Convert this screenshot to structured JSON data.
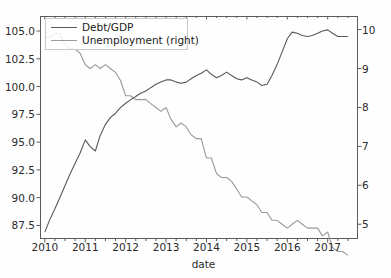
{
  "chart_data": {
    "type": "line",
    "title": "",
    "subtitle": "",
    "xlabel": "date",
    "ylabel": "",
    "ylabel_right": "",
    "grid": false,
    "legend_position": "upper-left",
    "x_ticks": [
      "2010",
      "2011",
      "2012",
      "2013",
      "2014",
      "2015",
      "2016",
      "2017"
    ],
    "x_tick_values": [
      2010,
      2011,
      2012,
      2013,
      2014,
      2015,
      2016,
      2017
    ],
    "xlim": [
      2009.88,
      2017.75
    ],
    "y_ticks_left": [
      "87.5",
      "90.0",
      "92.5",
      "95.0",
      "97.5",
      "100.0",
      "102.5",
      "105.0"
    ],
    "y_tick_values_left": [
      87.5,
      90.0,
      92.5,
      95.0,
      97.5,
      100.0,
      102.5,
      105.0
    ],
    "ylim_left": [
      86.28,
      106.35
    ],
    "y_ticks_right": [
      "5",
      "6",
      "7",
      "8",
      "9",
      "10"
    ],
    "y_tick_values_right": [
      5,
      6,
      7,
      8,
      9,
      10
    ],
    "ylim_right": [
      4.62,
      10.35
    ],
    "series": [
      {
        "name": "Debt/GDP",
        "axis": "left",
        "color": "#595959",
        "x": [
          2010.0,
          2010.12,
          2010.25,
          2010.37,
          2010.5,
          2010.62,
          2010.75,
          2010.87,
          2011.0,
          2011.12,
          2011.25,
          2011.37,
          2011.5,
          2011.62,
          2011.75,
          2011.87,
          2012.0,
          2012.12,
          2012.25,
          2012.37,
          2012.5,
          2012.62,
          2012.75,
          2012.87,
          2013.0,
          2013.12,
          2013.25,
          2013.37,
          2013.5,
          2013.62,
          2013.75,
          2013.87,
          2014.0,
          2014.12,
          2014.25,
          2014.37,
          2014.5,
          2014.62,
          2014.75,
          2014.87,
          2015.0,
          2015.12,
          2015.25,
          2015.37,
          2015.5,
          2015.62,
          2015.75,
          2015.87,
          2016.0,
          2016.12,
          2016.25,
          2016.37,
          2016.5,
          2016.62,
          2016.75,
          2016.87,
          2017.0,
          2017.12,
          2017.25,
          2017.37,
          2017.5
        ],
        "values": [
          86.9,
          88.0,
          89.0,
          90.0,
          91.1,
          92.1,
          93.1,
          94.0,
          95.2,
          94.6,
          94.2,
          95.6,
          96.6,
          97.2,
          97.6,
          98.1,
          98.5,
          98.8,
          99.1,
          99.4,
          99.6,
          99.9,
          100.2,
          100.4,
          100.6,
          100.6,
          100.4,
          100.3,
          100.4,
          100.7,
          101.0,
          101.2,
          101.5,
          101.1,
          100.8,
          101.0,
          101.3,
          101.0,
          100.7,
          100.6,
          100.8,
          100.6,
          100.4,
          100.1,
          100.2,
          101.0,
          102.0,
          103.1,
          104.3,
          104.9,
          104.8,
          104.6,
          104.5,
          104.6,
          104.8,
          105.0,
          105.1,
          104.8,
          104.5,
          104.5,
          104.5
        ]
      },
      {
        "name": "Unemployment (right)",
        "axis": "right",
        "color": "#9a9a9a",
        "x": [
          2010.0,
          2010.12,
          2010.25,
          2010.37,
          2010.5,
          2010.62,
          2010.75,
          2010.87,
          2011.0,
          2011.12,
          2011.25,
          2011.37,
          2011.5,
          2011.62,
          2011.75,
          2011.87,
          2012.0,
          2012.12,
          2012.25,
          2012.37,
          2012.5,
          2012.62,
          2012.75,
          2012.87,
          2013.0,
          2013.12,
          2013.25,
          2013.37,
          2013.5,
          2013.62,
          2013.75,
          2013.87,
          2014.0,
          2014.12,
          2014.25,
          2014.37,
          2014.5,
          2014.62,
          2014.75,
          2014.87,
          2015.0,
          2015.12,
          2015.25,
          2015.37,
          2015.5,
          2015.62,
          2015.75,
          2015.87,
          2016.0,
          2016.12,
          2016.25,
          2016.37,
          2016.5,
          2016.62,
          2016.75,
          2016.87,
          2017.0,
          2017.12,
          2017.25,
          2017.37,
          2017.5
        ],
        "values": [
          9.8,
          9.8,
          9.9,
          9.9,
          9.6,
          9.5,
          9.5,
          9.4,
          9.1,
          9.0,
          9.1,
          9.0,
          9.1,
          9.0,
          8.9,
          8.7,
          8.3,
          8.3,
          8.2,
          8.2,
          8.2,
          8.1,
          8.0,
          7.9,
          8.0,
          7.7,
          7.5,
          7.6,
          7.5,
          7.3,
          7.2,
          7.2,
          6.7,
          6.7,
          6.3,
          6.2,
          6.2,
          6.1,
          5.9,
          5.7,
          5.7,
          5.6,
          5.5,
          5.3,
          5.3,
          5.1,
          5.1,
          5.0,
          4.9,
          5.0,
          5.1,
          5.0,
          4.9,
          4.9,
          4.9,
          4.7,
          4.8,
          4.4,
          4.3,
          4.3,
          4.2
        ]
      }
    ]
  },
  "legend": {
    "entries": [
      {
        "label": "Debt/GDP"
      },
      {
        "label": "Unemployment (right)"
      }
    ]
  },
  "colors": {
    "debt_line": "#595959",
    "unemployment_line": "#9a9a9a",
    "axis": "#5b5b5b",
    "text": "#2a2a2a",
    "background": "#fefefe"
  }
}
